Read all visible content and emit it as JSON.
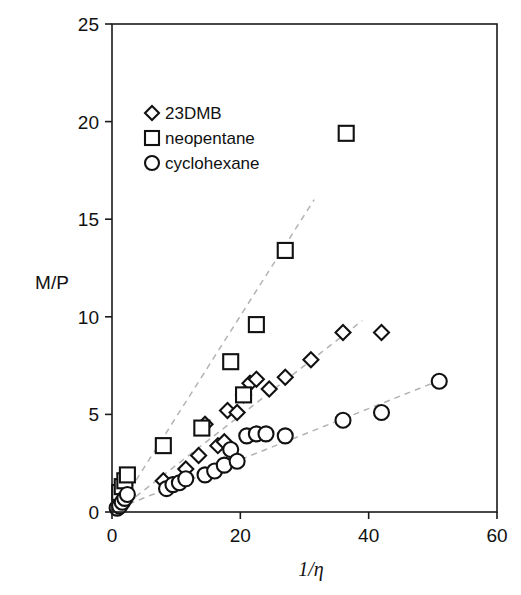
{
  "chart_data": {
    "type": "scatter",
    "title": "",
    "xlabel": "1/η",
    "ylabel": "M/P",
    "xlim": [
      0,
      60
    ],
    "ylim": [
      0,
      25
    ],
    "xticks": [
      0,
      20,
      40,
      60
    ],
    "yticks": [
      0,
      5,
      10,
      15,
      20,
      25
    ],
    "xtick_labels": [
      "0",
      "20",
      "40",
      "60"
    ],
    "ytick_labels": [
      "0",
      "5",
      "10",
      "15",
      "20",
      "25"
    ],
    "grid": false,
    "legend_position": "upper-left-inside",
    "series": [
      {
        "name": "23DMB",
        "marker": "diamond",
        "points": [
          [
            1.0,
            0.4
          ],
          [
            1.4,
            0.6
          ],
          [
            1.8,
            0.8
          ],
          [
            2.2,
            1.0
          ],
          [
            8.0,
            1.6
          ],
          [
            11.5,
            2.2
          ],
          [
            13.5,
            2.9
          ],
          [
            14.5,
            4.5
          ],
          [
            16.5,
            3.4
          ],
          [
            17.5,
            3.6
          ],
          [
            18.0,
            5.2
          ],
          [
            19.5,
            5.1
          ],
          [
            20.5,
            6.0
          ],
          [
            21.5,
            6.6
          ],
          [
            22.5,
            6.8
          ],
          [
            24.5,
            6.3
          ],
          [
            27.0,
            6.9
          ],
          [
            31.0,
            7.8
          ],
          [
            36.0,
            9.2
          ],
          [
            42.0,
            9.2
          ]
        ]
      },
      {
        "name": "neopentane",
        "marker": "square",
        "points": [
          [
            1.2,
            1.0
          ],
          [
            1.6,
            1.3
          ],
          [
            2.0,
            1.6
          ],
          [
            2.4,
            1.9
          ],
          [
            8.0,
            3.4
          ],
          [
            14.0,
            4.3
          ],
          [
            18.5,
            7.7
          ],
          [
            20.5,
            6.0
          ],
          [
            22.5,
            9.6
          ],
          [
            27.0,
            13.4
          ],
          [
            36.5,
            19.4
          ]
        ]
      },
      {
        "name": "cyclohexane",
        "marker": "circle",
        "points": [
          [
            0.8,
            0.2
          ],
          [
            1.2,
            0.3
          ],
          [
            1.6,
            0.5
          ],
          [
            2.0,
            0.7
          ],
          [
            2.4,
            0.9
          ],
          [
            8.5,
            1.2
          ],
          [
            9.5,
            1.4
          ],
          [
            10.5,
            1.5
          ],
          [
            11.5,
            1.7
          ],
          [
            14.5,
            1.9
          ],
          [
            16.0,
            2.1
          ],
          [
            17.5,
            2.4
          ],
          [
            18.5,
            3.2
          ],
          [
            19.5,
            2.6
          ],
          [
            21.0,
            3.9
          ],
          [
            22.5,
            4.0
          ],
          [
            24.0,
            4.0
          ],
          [
            27.0,
            3.9
          ],
          [
            36.0,
            4.7
          ],
          [
            42.0,
            5.1
          ],
          [
            51.0,
            6.7
          ]
        ]
      }
    ],
    "trend_lines": [
      {
        "series": "neopentane",
        "style": "dashed",
        "color": "#b3b3b3",
        "x": [
          1.0,
          31.5
        ],
        "y": [
          0.2,
          16.0
        ]
      },
      {
        "series": "23DMB",
        "style": "dashed",
        "color": "#b3b3b3",
        "x": [
          1.0,
          39.0
        ],
        "y": [
          0.1,
          9.8
        ]
      },
      {
        "series": "cyclohexane",
        "style": "dashed",
        "color": "#b3b3b3",
        "x": [
          1.0,
          51.5
        ],
        "y": [
          0.2,
          6.8
        ]
      }
    ]
  },
  "legend": {
    "entries": [
      {
        "label": "23DMB",
        "marker": "diamond"
      },
      {
        "label": "neopentane",
        "marker": "square"
      },
      {
        "label": "cyclohexane",
        "marker": "circle"
      }
    ]
  },
  "axes": {
    "y_title": "M/P",
    "x_title": "1/η"
  }
}
